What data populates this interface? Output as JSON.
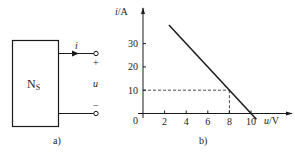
{
  "panel_a": {
    "label": "a)",
    "network_label": "N",
    "network_subscript": "S",
    "current_label": "i",
    "voltage_label": "u",
    "plus_sign": "+",
    "minus_sign": "−"
  },
  "panel_b": {
    "label": "b)",
    "chart_data": {
      "type": "line",
      "title": "",
      "xlabel": "u/V",
      "ylabel": "i/A",
      "xlabel_var": "u",
      "xlabel_unit": "/V",
      "ylabel_var": "i",
      "ylabel_unit": "/A",
      "origin_label": "0",
      "x_ticks": [
        2,
        4,
        6,
        8,
        10
      ],
      "y_ticks": [
        10,
        20,
        30
      ],
      "xlim": [
        0,
        12.3
      ],
      "ylim": [
        0,
        42
      ],
      "grid": false,
      "series": [
        {
          "name": "i-u characteristic",
          "x": [
            2.4,
            10.5
          ],
          "y": [
            38,
            -2.5
          ]
        }
      ],
      "annotations": [
        {
          "type": "dashed-guide",
          "x": 8,
          "y": 10
        }
      ]
    }
  },
  "colors": {
    "ink": "#1a1a1a",
    "background": "#ffffff"
  }
}
